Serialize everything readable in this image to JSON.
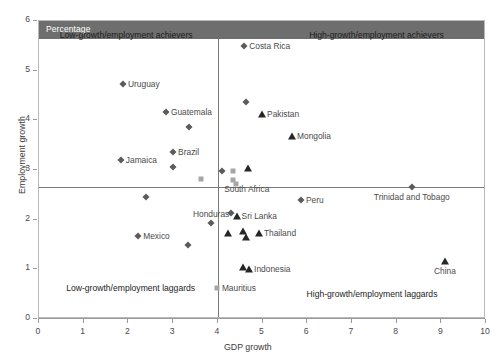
{
  "banner": {
    "text": "Percentage"
  },
  "axes": {
    "x_title": "GDP growth",
    "y_title": "Employment growth",
    "x_ticks": [
      "0",
      "1",
      "2",
      "3",
      "4",
      "5",
      "6",
      "7",
      "8",
      "9",
      "10"
    ],
    "y_ticks": [
      "0",
      "1",
      "2",
      "3",
      "4",
      "5",
      "6"
    ]
  },
  "quadrants": {
    "top_left": "Low-growth/employment achievers",
    "top_right": "High-growth/employment achievers",
    "bottom_left": "Low-growth/employment laggards",
    "bottom_right": "High-growth/employment laggards"
  },
  "chart_data": {
    "type": "scatter",
    "title": "Percentage",
    "xlabel": "GDP growth",
    "ylabel": "Employment growth",
    "xlim": [
      0,
      10
    ],
    "ylim": [
      0,
      6
    ],
    "xticks": [
      0,
      1,
      2,
      3,
      4,
      5,
      6,
      7,
      8,
      9,
      10
    ],
    "yticks": [
      0,
      1,
      2,
      3,
      4,
      5,
      6
    ],
    "grid": false,
    "legend": "none",
    "reference_lines": {
      "vertical_x": 4.0,
      "horizontal_y": 2.65
    },
    "quadrant_annotations": [
      {
        "text": "Low-growth/employment achievers",
        "x": 1.95,
        "y": 5.72
      },
      {
        "text": "High-growth/employment achievers",
        "x": 7.55,
        "y": 5.72
      },
      {
        "text": "Low-growth/employment laggards",
        "x": 2.05,
        "y": 0.62
      },
      {
        "text": "High-growth/employment laggards",
        "x": 7.45,
        "y": 0.5
      }
    ],
    "points": [
      {
        "label": "Costa Rica",
        "x": 4.59,
        "y": 5.49,
        "marker": "diamond",
        "label_side": "right"
      },
      {
        "label": "Uruguay",
        "x": 1.88,
        "y": 4.74,
        "marker": "diamond",
        "label_side": "right"
      },
      {
        "label": "Pakistan",
        "x": 4.99,
        "y": 4.13,
        "marker": "triangle",
        "label_side": "right"
      },
      {
        "label": "Guatemala",
        "x": 2.84,
        "y": 4.16,
        "marker": "diamond",
        "label_side": "right"
      },
      {
        "label": "",
        "x": 4.62,
        "y": 4.36,
        "marker": "diamond",
        "label_side": "right"
      },
      {
        "label": "",
        "x": 3.36,
        "y": 3.87,
        "marker": "diamond",
        "label_side": "right"
      },
      {
        "label": "Mongolia",
        "x": 5.66,
        "y": 3.68,
        "marker": "triangle",
        "label_side": "right"
      },
      {
        "label": "Brazil",
        "x": 3.0,
        "y": 3.37,
        "marker": "diamond",
        "label_side": "right"
      },
      {
        "label": "Jamaica",
        "x": 1.83,
        "y": 3.21,
        "marker": "diamond",
        "label_side": "right"
      },
      {
        "label": "",
        "x": 3.0,
        "y": 3.06,
        "marker": "diamond",
        "label_side": "right"
      },
      {
        "label": "",
        "x": 3.62,
        "y": 2.82,
        "marker": "square",
        "label_side": "right"
      },
      {
        "label": "",
        "x": 4.1,
        "y": 2.97,
        "marker": "diamond",
        "label_side": "right"
      },
      {
        "label": "",
        "x": 4.33,
        "y": 2.97,
        "marker": "square",
        "label_side": "right"
      },
      {
        "label": "",
        "x": 4.68,
        "y": 3.04,
        "marker": "triangle",
        "label_side": "right"
      },
      {
        "label": "",
        "x": 4.33,
        "y": 2.8,
        "marker": "square",
        "label_side": "right"
      },
      {
        "label": "",
        "x": 4.4,
        "y": 2.72,
        "marker": "square",
        "label_side": "right"
      },
      {
        "label": "South Africa",
        "x": 4.03,
        "y": 2.61,
        "marker": "none",
        "label_side": "right"
      },
      {
        "label": "",
        "x": 2.4,
        "y": 2.45,
        "marker": "diamond",
        "label_side": "right"
      },
      {
        "label": "Trinidad and Tobago",
        "x": 8.34,
        "y": 2.65,
        "marker": "diamond",
        "label_side": "below"
      },
      {
        "label": "Peru",
        "x": 5.86,
        "y": 2.4,
        "marker": "diamond",
        "label_side": "right"
      },
      {
        "label": "Sri Lanka",
        "x": 4.42,
        "y": 2.08,
        "marker": "triangle",
        "label_side": "right"
      },
      {
        "label": "",
        "x": 4.3,
        "y": 2.14,
        "marker": "diamond",
        "label_side": "right"
      },
      {
        "label": "Honduras",
        "x": 3.85,
        "y": 1.93,
        "marker": "diamond",
        "label_side": "above"
      },
      {
        "label": "",
        "x": 4.22,
        "y": 1.73,
        "marker": "triangle",
        "label_side": "right"
      },
      {
        "label": "",
        "x": 4.56,
        "y": 1.77,
        "marker": "triangle",
        "label_side": "right"
      },
      {
        "label": "",
        "x": 4.62,
        "y": 1.65,
        "marker": "triangle",
        "label_side": "right"
      },
      {
        "label": "Thailand",
        "x": 4.92,
        "y": 1.73,
        "marker": "triangle",
        "label_side": "right"
      },
      {
        "label": "Mexico",
        "x": 2.22,
        "y": 1.68,
        "marker": "diamond",
        "label_side": "right"
      },
      {
        "label": "",
        "x": 3.33,
        "y": 1.49,
        "marker": "diamond",
        "label_side": "right"
      },
      {
        "label": "",
        "x": 4.56,
        "y": 1.05,
        "marker": "triangle",
        "label_side": "right"
      },
      {
        "label": "Indonesia",
        "x": 4.7,
        "y": 1.0,
        "marker": "triangle",
        "label_side": "right"
      },
      {
        "label": "China",
        "x": 9.08,
        "y": 1.16,
        "marker": "triangle",
        "label_side": "below"
      },
      {
        "label": "Mauritius",
        "x": 3.98,
        "y": 0.62,
        "marker": "square",
        "label_side": "right"
      }
    ]
  }
}
